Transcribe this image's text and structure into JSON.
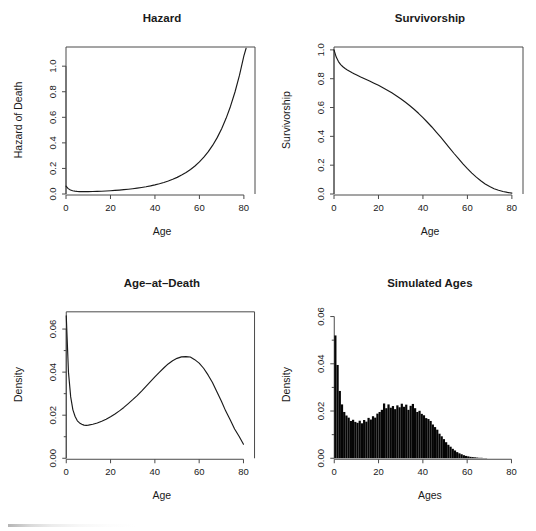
{
  "figure": {
    "width": 536,
    "height": 531,
    "background": "#ffffff",
    "foreground": "#1a1a1a",
    "axis_color": "#4a4a4a",
    "layout": "2x2 panel grid"
  },
  "chart_data": [
    {
      "type": "line",
      "panel": "top-left",
      "title": "Hazard",
      "xlabel": "Age",
      "ylabel": "Hazard of Death",
      "xlim": [
        0,
        85
      ],
      "ylim": [
        0.0,
        1.15
      ],
      "xticks": [
        0,
        20,
        40,
        60,
        80
      ],
      "xtick_labels": [
        "0",
        "20",
        "40",
        "60",
        "80"
      ],
      "yticks": [
        0.0,
        0.2,
        0.4,
        0.6,
        0.8,
        1.0
      ],
      "ytick_labels": [
        "0.0",
        "0.2",
        "0.4",
        "0.6",
        "0.8",
        "1.0"
      ],
      "grid": false,
      "legend": null,
      "box": true,
      "x": [
        0,
        1,
        2,
        3,
        4,
        5,
        6,
        7,
        8,
        9,
        10,
        12,
        14,
        16,
        18,
        20,
        22,
        24,
        26,
        28,
        30,
        32,
        34,
        36,
        38,
        40,
        42,
        44,
        46,
        48,
        50,
        52,
        54,
        56,
        58,
        60,
        62,
        64,
        66,
        68,
        70,
        72,
        74,
        76,
        78,
        80,
        81
      ],
      "values": [
        0.062,
        0.042,
        0.031,
        0.025,
        0.022,
        0.02,
        0.019,
        0.0185,
        0.0183,
        0.0184,
        0.0186,
        0.0194,
        0.0205,
        0.0219,
        0.0236,
        0.0256,
        0.0279,
        0.0306,
        0.0337,
        0.0372,
        0.0412,
        0.0457,
        0.0509,
        0.0568,
        0.0636,
        0.0713,
        0.0801,
        0.0902,
        0.102,
        0.115,
        0.13,
        0.148,
        0.168,
        0.192,
        0.219,
        0.251,
        0.288,
        0.331,
        0.382,
        0.441,
        0.511,
        0.592,
        0.687,
        0.798,
        0.928,
        1.08,
        1.14
      ]
    },
    {
      "type": "line",
      "panel": "top-right",
      "title": "Survivorship",
      "xlabel": "Age",
      "ylabel": "Survivorship",
      "xlim": [
        0,
        85
      ],
      "ylim": [
        0.0,
        1.02
      ],
      "xticks": [
        0,
        20,
        40,
        60,
        80
      ],
      "xtick_labels": [
        "0",
        "20",
        "40",
        "60",
        "80"
      ],
      "yticks": [
        0.0,
        0.2,
        0.4,
        0.6,
        0.8,
        1.0
      ],
      "ytick_labels": [
        "0.0",
        "0.2",
        "0.4",
        "0.6",
        "0.8",
        "1.0"
      ],
      "grid": false,
      "legend": null,
      "box": true,
      "x": [
        0,
        1,
        2,
        3,
        4,
        5,
        6,
        7,
        8,
        9,
        10,
        12,
        14,
        16,
        18,
        20,
        22,
        24,
        26,
        28,
        30,
        32,
        34,
        36,
        38,
        40,
        42,
        44,
        46,
        48,
        50,
        52,
        54,
        56,
        58,
        60,
        62,
        64,
        66,
        68,
        70,
        72,
        74,
        76,
        78,
        80
      ],
      "values": [
        1.0,
        0.95,
        0.919,
        0.898,
        0.883,
        0.871,
        0.861,
        0.852,
        0.843,
        0.835,
        0.827,
        0.812,
        0.798,
        0.784,
        0.769,
        0.754,
        0.737,
        0.72,
        0.702,
        0.682,
        0.661,
        0.638,
        0.614,
        0.588,
        0.56,
        0.53,
        0.498,
        0.465,
        0.43,
        0.394,
        0.357,
        0.319,
        0.281,
        0.245,
        0.209,
        0.176,
        0.145,
        0.117,
        0.092,
        0.07,
        0.052,
        0.037,
        0.026,
        0.017,
        0.011,
        0.006
      ]
    },
    {
      "type": "line",
      "panel": "bottom-left",
      "title": "Age–at–Death",
      "xlabel": "Age",
      "ylabel": "Density",
      "xlim": [
        0,
        85
      ],
      "ylim": [
        0.0,
        0.068
      ],
      "xticks": [
        0,
        20,
        40,
        60,
        80
      ],
      "xtick_labels": [
        "0",
        "20",
        "40",
        "60",
        "80"
      ],
      "yticks": [
        0.0,
        0.02,
        0.04,
        0.06
      ],
      "ytick_labels": [
        "0.00",
        "0.02",
        "0.04",
        "0.06"
      ],
      "yminorticks": [
        0.01,
        0.03,
        0.05
      ],
      "grid": false,
      "legend": null,
      "box": true,
      "x": [
        0,
        1,
        2,
        3,
        4,
        5,
        6,
        7,
        8,
        9,
        10,
        12,
        14,
        16,
        18,
        20,
        22,
        24,
        26,
        28,
        30,
        32,
        34,
        36,
        38,
        40,
        42,
        44,
        46,
        48,
        50,
        52,
        54,
        56,
        58,
        60,
        62,
        64,
        66,
        68,
        70,
        72,
        74,
        76,
        78,
        80
      ],
      "values": [
        0.0662,
        0.04,
        0.0285,
        0.0225,
        0.0194,
        0.0174,
        0.0164,
        0.0158,
        0.0154,
        0.0153,
        0.0154,
        0.0158,
        0.0164,
        0.0172,
        0.0181,
        0.0193,
        0.0206,
        0.022,
        0.0236,
        0.0254,
        0.0272,
        0.0291,
        0.0312,
        0.0334,
        0.0356,
        0.0378,
        0.0399,
        0.0419,
        0.0438,
        0.0453,
        0.0464,
        0.0471,
        0.0472,
        0.047,
        0.0458,
        0.0442,
        0.0418,
        0.0387,
        0.0352,
        0.0309,
        0.0266,
        0.0219,
        0.0179,
        0.0136,
        0.0102,
        0.0065
      ]
    },
    {
      "type": "bar",
      "panel": "bottom-right",
      "subtype": "histogram",
      "title": "Simulated Ages",
      "xlabel": "Ages",
      "ylabel": "Density",
      "xlim": [
        0,
        85
      ],
      "ylim": [
        0.0,
        0.062
      ],
      "binwidth": 1,
      "xticks": [
        0,
        20,
        40,
        60,
        80
      ],
      "xtick_labels": [
        "0",
        "20",
        "40",
        "60",
        "80"
      ],
      "yticks": [
        0.0,
        0.02,
        0.04,
        0.06
      ],
      "ytick_labels": [
        "0.00",
        "0.02",
        "0.04",
        "0.06"
      ],
      "yminorticks": [
        0.01,
        0.03,
        0.05
      ],
      "grid": false,
      "legend": null,
      "box": false,
      "bar_color": "#050505",
      "bin_starts": [
        0,
        1,
        2,
        3,
        4,
        5,
        6,
        7,
        8,
        9,
        10,
        11,
        12,
        13,
        14,
        15,
        16,
        17,
        18,
        19,
        20,
        21,
        22,
        23,
        24,
        25,
        26,
        27,
        28,
        29,
        30,
        31,
        32,
        33,
        34,
        35,
        36,
        37,
        38,
        39,
        40,
        41,
        42,
        43,
        44,
        45,
        46,
        47,
        48,
        49,
        50,
        51,
        52,
        53,
        54,
        55,
        56,
        57,
        58,
        59,
        60,
        61,
        62,
        63,
        64,
        65,
        66,
        67,
        68
      ],
      "values": [
        0.052,
        0.0395,
        0.0285,
        0.0228,
        0.0196,
        0.0181,
        0.0172,
        0.0158,
        0.0163,
        0.0154,
        0.015,
        0.0159,
        0.0148,
        0.0162,
        0.0155,
        0.0171,
        0.0164,
        0.0178,
        0.0172,
        0.0189,
        0.0196,
        0.0205,
        0.0232,
        0.0212,
        0.0228,
        0.0214,
        0.0221,
        0.0208,
        0.0224,
        0.0216,
        0.0231,
        0.0218,
        0.0227,
        0.0205,
        0.0222,
        0.023,
        0.0212,
        0.0196,
        0.0201,
        0.0188,
        0.0182,
        0.017,
        0.0166,
        0.0158,
        0.0143,
        0.0132,
        0.0121,
        0.0104,
        0.0093,
        0.0081,
        0.0068,
        0.0057,
        0.0049,
        0.004,
        0.0033,
        0.0026,
        0.0021,
        0.0017,
        0.0013,
        0.001,
        0.0008,
        0.0006,
        0.0005,
        0.0004,
        0.0003,
        0.0002,
        0.0002,
        0.0001,
        0.0001
      ]
    }
  ]
}
